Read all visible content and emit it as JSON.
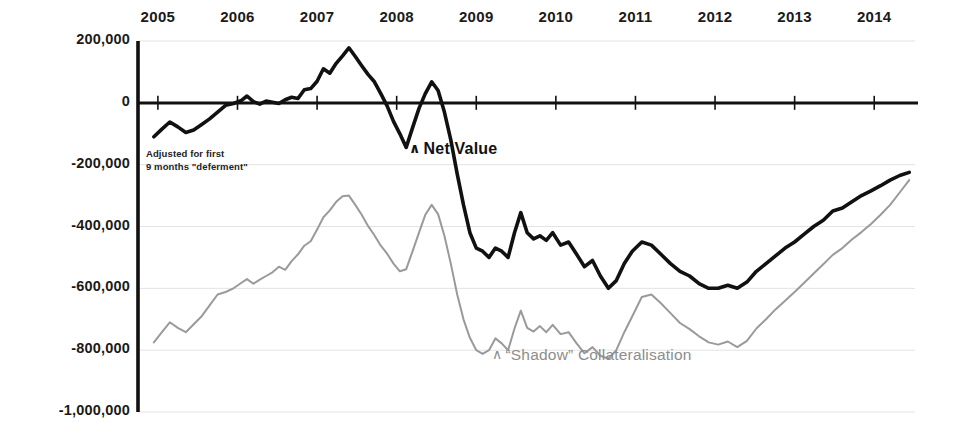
{
  "chart_data": {
    "type": "line",
    "title": "",
    "xlabel": "",
    "ylabel": "",
    "xlim": [
      2004.75,
      2014.55
    ],
    "ylim": [
      -1000000,
      200000
    ],
    "grid": true,
    "legend_position": "inline-annotations",
    "x_tick_labels": [
      "2005",
      "2006",
      "2007",
      "2008",
      "2009",
      "2010",
      "2011",
      "2012",
      "2013",
      "2014"
    ],
    "x_ticks": [
      2005,
      2006,
      2007,
      2008,
      2009,
      2010,
      2011,
      2012,
      2013,
      2014
    ],
    "y_tick_labels": [
      "200,000",
      "0",
      "-200,000",
      "-400,000",
      "-600,000",
      "-800,000",
      "-1,000,000"
    ],
    "y_ticks": [
      200000,
      0,
      -200000,
      -400000,
      -600000,
      -800000,
      -1000000
    ],
    "annotations": [
      {
        "id": "deferment-note",
        "text_line1": "Adjusted for first",
        "text_line2": "9 months \"deferment\""
      },
      {
        "id": "net-value-label",
        "text": "Net Value",
        "marker": "∧",
        "color": "#111111"
      },
      {
        "id": "shadow-label",
        "text": "“Shadow” Collateralisation",
        "marker": "∧",
        "color": "#8d8d8d"
      }
    ],
    "series": [
      {
        "name": "Net Value",
        "color": "#111111",
        "width": 3.6,
        "x": [
          2004.95,
          2005.05,
          2005.15,
          2005.25,
          2005.35,
          2005.45,
          2005.55,
          2005.65,
          2005.75,
          2005.85,
          2005.95,
          2006.05,
          2006.12,
          2006.2,
          2006.28,
          2006.36,
          2006.44,
          2006.52,
          2006.6,
          2006.68,
          2006.76,
          2006.84,
          2006.92,
          2007.0,
          2007.08,
          2007.16,
          2007.24,
          2007.32,
          2007.4,
          2007.48,
          2007.56,
          2007.64,
          2007.72,
          2007.8,
          2007.88,
          2007.96,
          2008.04,
          2008.12,
          2008.2,
          2008.28,
          2008.36,
          2008.44,
          2008.52,
          2008.6,
          2008.68,
          2008.76,
          2008.84,
          2008.92,
          2009.0,
          2009.08,
          2009.16,
          2009.24,
          2009.32,
          2009.4,
          2009.48,
          2009.56,
          2009.64,
          2009.72,
          2009.8,
          2009.88,
          2009.96,
          2010.06,
          2010.16,
          2010.26,
          2010.36,
          2010.46,
          2010.56,
          2010.66,
          2010.76,
          2010.86,
          2010.96,
          2011.08,
          2011.2,
          2011.32,
          2011.44,
          2011.56,
          2011.68,
          2011.8,
          2011.92,
          2012.04,
          2012.16,
          2012.28,
          2012.4,
          2012.52,
          2012.64,
          2012.76,
          2012.88,
          2013.0,
          2013.12,
          2013.24,
          2013.36,
          2013.48,
          2013.6,
          2013.72,
          2013.84,
          2013.96,
          2014.08,
          2014.2,
          2014.32,
          2014.44
        ],
        "y": [
          -110000,
          -85000,
          -62000,
          -78000,
          -96000,
          -88000,
          -70000,
          -52000,
          -30000,
          -8000,
          -2000,
          8000,
          22000,
          4000,
          -4000,
          6000,
          2000,
          -2000,
          10000,
          18000,
          14000,
          42000,
          46000,
          70000,
          110000,
          96000,
          128000,
          152000,
          178000,
          150000,
          120000,
          92000,
          68000,
          30000,
          -10000,
          -60000,
          -100000,
          -144000,
          -80000,
          -18000,
          30000,
          68000,
          40000,
          -30000,
          -120000,
          -230000,
          -330000,
          -420000,
          -470000,
          -480000,
          -500000,
          -470000,
          -480000,
          -500000,
          -420000,
          -355000,
          -420000,
          -440000,
          -430000,
          -445000,
          -420000,
          -460000,
          -450000,
          -490000,
          -530000,
          -510000,
          -560000,
          -600000,
          -575000,
          -520000,
          -480000,
          -450000,
          -460000,
          -490000,
          -520000,
          -545000,
          -560000,
          -585000,
          -600000,
          -600000,
          -590000,
          -600000,
          -580000,
          -545000,
          -520000,
          -495000,
          -470000,
          -450000,
          -425000,
          -400000,
          -380000,
          -350000,
          -340000,
          -320000,
          -300000,
          -285000,
          -268000,
          -250000,
          -235000,
          -225000
        ]
      },
      {
        "name": "\"Shadow\" Collateralisation",
        "color": "#9a9a9a",
        "width": 2.0,
        "x": [
          2004.95,
          2005.05,
          2005.15,
          2005.25,
          2005.35,
          2005.45,
          2005.55,
          2005.65,
          2005.75,
          2005.85,
          2005.95,
          2006.05,
          2006.12,
          2006.2,
          2006.28,
          2006.36,
          2006.44,
          2006.52,
          2006.6,
          2006.68,
          2006.76,
          2006.84,
          2006.92,
          2007.0,
          2007.08,
          2007.16,
          2007.24,
          2007.32,
          2007.4,
          2007.48,
          2007.56,
          2007.64,
          2007.72,
          2007.8,
          2007.88,
          2007.96,
          2008.04,
          2008.12,
          2008.2,
          2008.28,
          2008.36,
          2008.44,
          2008.52,
          2008.6,
          2008.68,
          2008.76,
          2008.84,
          2008.92,
          2009.0,
          2009.08,
          2009.16,
          2009.24,
          2009.32,
          2009.4,
          2009.48,
          2009.56,
          2009.64,
          2009.72,
          2009.8,
          2009.88,
          2009.96,
          2010.06,
          2010.16,
          2010.26,
          2010.36,
          2010.46,
          2010.56,
          2010.66,
          2010.76,
          2010.86,
          2010.96,
          2011.08,
          2011.2,
          2011.32,
          2011.44,
          2011.56,
          2011.68,
          2011.8,
          2011.92,
          2012.04,
          2012.16,
          2012.28,
          2012.4,
          2012.52,
          2012.64,
          2012.76,
          2012.88,
          2013.0,
          2013.12,
          2013.24,
          2013.36,
          2013.48,
          2013.6,
          2013.72,
          2013.84,
          2013.96,
          2014.08,
          2014.2,
          2014.32,
          2014.44
        ],
        "y": [
          -775000,
          -742000,
          -710000,
          -728000,
          -742000,
          -716000,
          -690000,
          -655000,
          -620000,
          -612000,
          -600000,
          -582000,
          -570000,
          -585000,
          -572000,
          -560000,
          -548000,
          -530000,
          -540000,
          -512000,
          -490000,
          -462000,
          -448000,
          -410000,
          -370000,
          -348000,
          -320000,
          -302000,
          -300000,
          -330000,
          -362000,
          -398000,
          -428000,
          -462000,
          -488000,
          -520000,
          -545000,
          -538000,
          -480000,
          -420000,
          -362000,
          -330000,
          -360000,
          -430000,
          -520000,
          -620000,
          -700000,
          -760000,
          -800000,
          -812000,
          -800000,
          -762000,
          -778000,
          -800000,
          -730000,
          -672000,
          -728000,
          -740000,
          -722000,
          -742000,
          -718000,
          -748000,
          -742000,
          -778000,
          -810000,
          -790000,
          -818000,
          -828000,
          -800000,
          -742000,
          -690000,
          -628000,
          -620000,
          -648000,
          -680000,
          -712000,
          -732000,
          -755000,
          -775000,
          -782000,
          -772000,
          -790000,
          -770000,
          -730000,
          -700000,
          -668000,
          -640000,
          -612000,
          -582000,
          -552000,
          -522000,
          -492000,
          -470000,
          -442000,
          -418000,
          -392000,
          -362000,
          -330000,
          -290000,
          -250000
        ]
      }
    ]
  },
  "axis": {
    "zero_line_color": "#111111",
    "y_axis_color": "#111111",
    "gridline_color": "#e3e3e3"
  }
}
